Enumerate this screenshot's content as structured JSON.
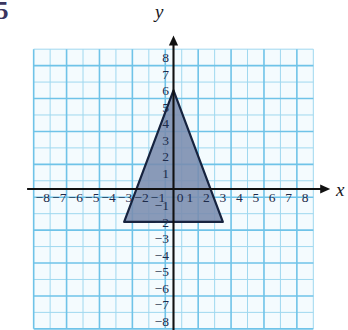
{
  "figure": {
    "problem_number": "5",
    "axis_labels": {
      "x": "x",
      "y": "y"
    },
    "origin_label": "0"
  },
  "chart_data": {
    "type": "scatter",
    "title": "",
    "xlabel": "x",
    "ylabel": "y",
    "xlim": [
      -8.5,
      8.5
    ],
    "ylim": [
      -8.5,
      8.5
    ],
    "grid": true,
    "legend": null,
    "x_ticks": [
      -8,
      -7,
      -6,
      -5,
      -4,
      -3,
      -2,
      -1,
      0,
      1,
      2,
      3,
      4,
      5,
      6,
      7,
      8
    ],
    "y_ticks": [
      -8,
      -7,
      -6,
      -5,
      -4,
      -3,
      -2,
      -1,
      1,
      2,
      3,
      4,
      5,
      6,
      7,
      8
    ],
    "x_tick_labels": [
      "-8",
      "-7",
      "-6",
      "-5",
      "-4",
      "-3",
      "-2",
      "-1",
      "0",
      "1",
      "2",
      "3",
      "4",
      "5",
      "6",
      "7",
      "8"
    ],
    "y_tick_labels": [
      "-8",
      "-7",
      "-6",
      "-5",
      "-4",
      "-3",
      "-2",
      "-1",
      "1",
      "2",
      "3",
      "4",
      "5",
      "6",
      "7",
      "8"
    ],
    "shapes": [
      {
        "name": "triangle",
        "kind": "polygon",
        "vertices": [
          [
            0,
            6
          ],
          [
            3,
            -2
          ],
          [
            -3,
            -2
          ]
        ],
        "fill": "#7a8cae",
        "stroke": "#16233f"
      }
    ],
    "colors": {
      "grid_minor": "#9fd8ef",
      "grid_major": "#6fc3e8",
      "grid_background": "#f4fbfe",
      "axis": "#111111",
      "tick_text": "#1d2b4a",
      "shape_fill": "#7a8cae",
      "shape_stroke": "#16233f",
      "problem_number": "#3a3560"
    }
  }
}
